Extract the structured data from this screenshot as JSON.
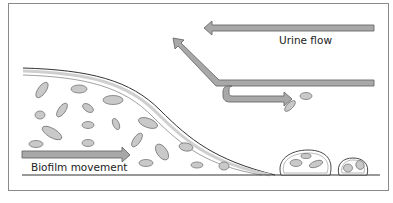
{
  "diagram": {
    "labels": {
      "urine_flow": "Urine flow",
      "biofilm_movement": "Biofilm movement"
    },
    "colors": {
      "frame": "#8a8a8a",
      "arrow_fill": "#a8a8a8",
      "arrow_stroke": "#6a6a6a",
      "cell_fill": "#c9c9c9",
      "cell_stroke": "#777777",
      "surface_line": "#333333"
    }
  }
}
